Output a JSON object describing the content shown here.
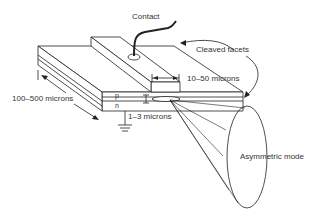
{
  "diagram": {
    "labels": {
      "contact": "Contact",
      "cleaved_facets": "Cleaved facets",
      "stripe_width": "10–50 microns",
      "length": "100–500 microns",
      "p_layer": "p",
      "n_layer": "n",
      "active_thickness": "1–3 microns",
      "mode": "Asymmetric mode"
    },
    "colors": {
      "line": "#222222",
      "text": "#333333",
      "background": "#ffffff"
    }
  }
}
